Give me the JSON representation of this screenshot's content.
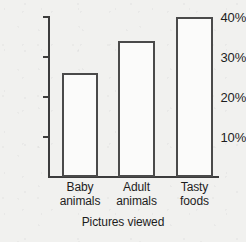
{
  "chart_data": {
    "type": "bar",
    "title": "",
    "xlabel": "Pictures viewed",
    "ylabel": "",
    "categories": [
      "Baby animals",
      "Adult animals",
      "Tasty foods"
    ],
    "category_lines": [
      [
        "Baby",
        "animals"
      ],
      [
        "Adult",
        "animals"
      ],
      [
        "Tasty",
        "foods"
      ]
    ],
    "values": [
      26,
      34,
      40
    ],
    "value_labels": [
      "26%",
      "34%",
      "40%"
    ],
    "ytick_labels": [
      "40%",
      "30%",
      "20%",
      "10%"
    ],
    "ytick_values": [
      40,
      30,
      20,
      10
    ],
    "ylim": [
      0,
      42
    ],
    "grid": false,
    "legend": null,
    "colors": {
      "bar_fill": "#fbfbfa",
      "bar_outline": "#4a4a4a",
      "axis": "#3c3c3c",
      "text": "#1d1d1d",
      "background": "#f1f1ef"
    }
  }
}
